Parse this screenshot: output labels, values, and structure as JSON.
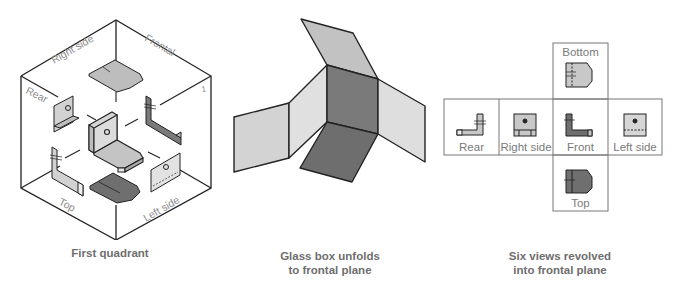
{
  "panels": [
    {
      "id": "first-quadrant",
      "caption_line1": "First quadrant",
      "caption_line2": "",
      "face_labels": {
        "right_side": "Right side",
        "frontal": "Frontal",
        "rear": "Rear",
        "top": "Top",
        "left_side": "Left side",
        "marker": "1"
      }
    },
    {
      "id": "glass-box-unfolds",
      "caption_line1": "Glass box unfolds",
      "caption_line2": "to frontal plane"
    },
    {
      "id": "six-views",
      "caption_line1": "Six views revolved",
      "caption_line2": "into frontal plane",
      "view_labels": {
        "bottom": "Bottom",
        "rear": "Rear",
        "right_side": "Right side",
        "front": "Front",
        "left_side": "Left side",
        "top": "Top"
      }
    }
  ],
  "colors": {
    "line": "#222222",
    "light_gray": "#d6d6d6",
    "mid_gray": "#bdbdbd",
    "dark_gray": "#6f6f6f",
    "label_gray": "#8a8a8a"
  }
}
